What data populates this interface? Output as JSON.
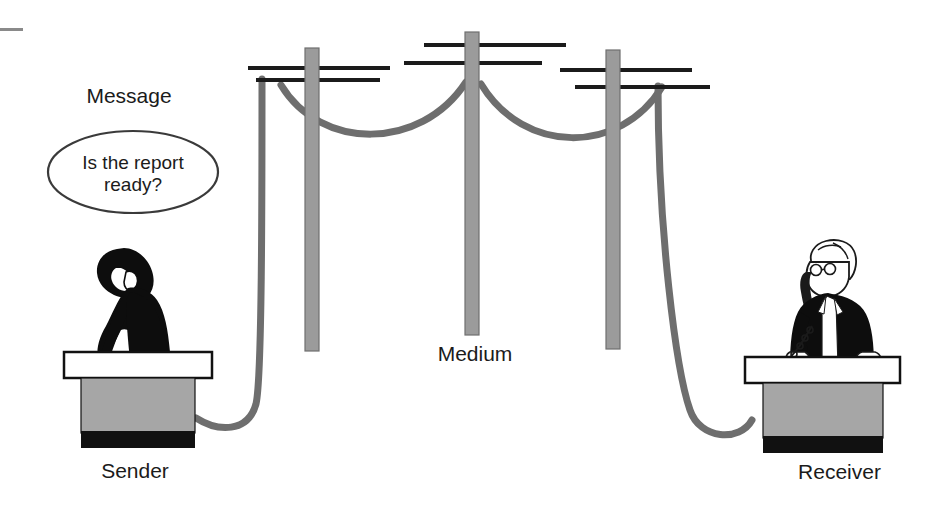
{
  "diagram": {
    "title_labels": {
      "message": "Message",
      "medium": "Medium",
      "sender": "Sender",
      "receiver": "Receiver"
    },
    "speech_bubble": {
      "line1": "Is the report",
      "line2": "ready?",
      "text": "Is the report\nready?"
    },
    "icons": {
      "sender_figure": "person-silhouette-on-phone-icon",
      "receiver_figure": "man-with-glasses-on-phone-icon",
      "pole_1": "utility-pole-icon",
      "pole_2": "utility-pole-icon",
      "pole_3": "utility-pole-icon",
      "cable": "telephone-cable-icon",
      "desk_sender": "desk-icon",
      "desk_receiver": "desk-icon",
      "corner_dash": "corner-dash-mark"
    },
    "colors": {
      "background": "#ffffff",
      "ink": "#1b1b1b",
      "pole_gray": "#9b9b9b",
      "pole_outline": "#6f6f6f",
      "cable_gray": "#6e6e6e",
      "desk_gray": "#a6a6a6",
      "desk_black": "#111111",
      "desk_top_white": "#ffffff",
      "corner_dash": "#8a8a8a"
    }
  }
}
